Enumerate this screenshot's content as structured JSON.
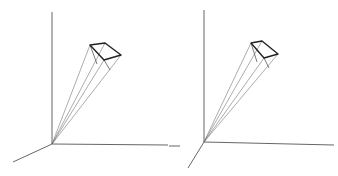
{
  "figure": {
    "panels": [
      {
        "id": "left",
        "origin": [
          52,
          144
        ],
        "axes": {
          "vertical": [
            [
              52,
              144
            ],
            [
              52,
              12
            ]
          ],
          "horizontal": [
            [
              52,
              144
            ],
            [
              168,
              145
            ]
          ],
          "diagonal": [
            [
              52,
              144
            ],
            [
              13,
              162
            ]
          ]
        },
        "apex": [
          52,
          144
        ],
        "box_top": [
          [
            90,
            45
          ],
          [
            105,
            43
          ],
          [
            121,
            55
          ],
          [
            104,
            60
          ]
        ],
        "box_bottom": [
          [
            97,
            64
          ],
          [
            110,
            70
          ]
        ]
      },
      {
        "id": "right",
        "origin": [
          204,
          142
        ],
        "axes": {
          "vertical": [
            [
              204,
              142
            ],
            [
              204,
              10
            ]
          ],
          "horizontal": [
            [
              204,
              142
            ],
            [
              334,
              145
            ]
          ],
          "diagonal": [
            [
              204,
              142
            ],
            [
              188,
              168
            ]
          ],
          "stub": [
            [
              169,
              146
            ],
            [
              180,
              146
            ]
          ]
        },
        "apex": [
          204,
          142
        ],
        "box_top": [
          [
            251,
            43
          ],
          [
            262,
            41
          ],
          [
            278,
            54
          ],
          [
            264,
            58
          ]
        ],
        "box_bottom": [
          [
            257,
            62
          ],
          [
            269,
            68
          ]
        ]
      }
    ]
  }
}
